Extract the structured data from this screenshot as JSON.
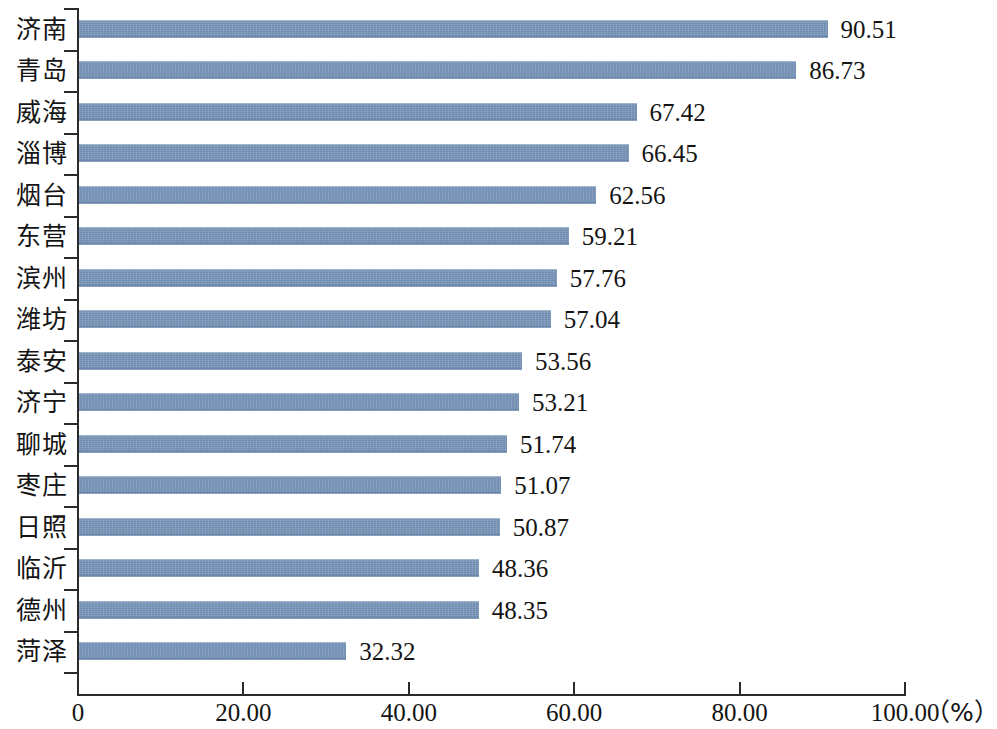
{
  "chart_data": {
    "type": "bar",
    "orientation": "horizontal",
    "title": "",
    "xlabel": "（%）",
    "ylabel": "",
    "xlim": [
      0,
      100
    ],
    "grid": false,
    "legend": null,
    "bar_color": "#6e8cb0",
    "axis_color": "#2b2b2b",
    "categories": [
      "济南",
      "青岛",
      "威海",
      "淄博",
      "烟台",
      "东营",
      "滨州",
      "潍坊",
      "泰安",
      "济宁",
      "聊城",
      "枣庄",
      "日照",
      "临沂",
      "德州",
      "菏泽"
    ],
    "values": [
      90.51,
      86.73,
      67.42,
      66.45,
      62.56,
      59.21,
      57.76,
      57.04,
      53.56,
      53.21,
      51.74,
      51.07,
      50.87,
      48.36,
      48.35,
      32.32
    ],
    "value_labels": [
      "90.51",
      "86.73",
      "67.42",
      "66.45",
      "62.56",
      "59.21",
      "57.76",
      "57.04",
      "53.56",
      "53.21",
      "51.74",
      "51.07",
      "50.87",
      "48.36",
      "48.35",
      "32.32"
    ],
    "xticks": [
      0,
      20,
      40,
      60,
      80,
      100
    ],
    "xtick_labels": [
      "0",
      "20.00",
      "40.00",
      "60.00",
      "80.00",
      "100.00"
    ],
    "unit_label": "（%）"
  }
}
